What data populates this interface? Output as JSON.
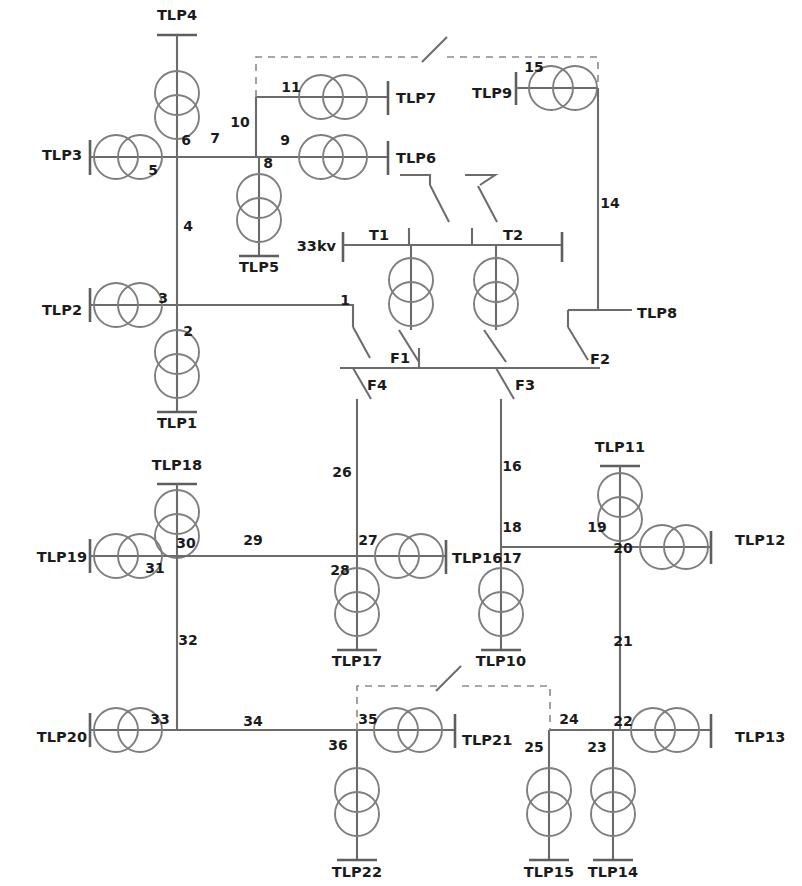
{
  "diagram": {
    "type": "single-line-diagram",
    "voltage_label": "33kv",
    "colors": {
      "wire": "#6b6b6b",
      "text": "#1b1b1b",
      "transformer": "#7e7e7e",
      "dashed_tie": "#8a8a8a",
      "background": "#ffffff"
    },
    "station_labels": [
      {
        "id": "tlp1",
        "text": "TLP1",
        "x": 177,
        "y": 428,
        "anchor": "middle"
      },
      {
        "id": "tlp2",
        "text": "TLP2",
        "x": 62,
        "y": 315,
        "anchor": "middle"
      },
      {
        "id": "tlp3",
        "text": "TLP3",
        "x": 62,
        "y": 160,
        "anchor": "middle"
      },
      {
        "id": "tlp4",
        "text": "TLP4",
        "x": 177,
        "y": 20,
        "anchor": "middle"
      },
      {
        "id": "tlp5",
        "text": "TLP5",
        "x": 259,
        "y": 272,
        "anchor": "middle"
      },
      {
        "id": "tlp6",
        "text": "TLP6",
        "x": 396,
        "y": 163,
        "anchor": "start"
      },
      {
        "id": "tlp7",
        "text": "TLP7",
        "x": 396,
        "y": 103,
        "anchor": "start"
      },
      {
        "id": "tlp8",
        "text": "TLP8",
        "x": 637,
        "y": 318,
        "anchor": "start"
      },
      {
        "id": "tlp9",
        "text": "TLP9",
        "x": 472,
        "y": 98,
        "anchor": "start"
      },
      {
        "id": "tlp10",
        "text": "TLP10",
        "x": 501,
        "y": 666,
        "anchor": "middle"
      },
      {
        "id": "tlp11",
        "text": "TLP11",
        "x": 620,
        "y": 452,
        "anchor": "middle"
      },
      {
        "id": "tlp12",
        "text": "TLP12",
        "x": 735,
        "y": 545,
        "anchor": "start"
      },
      {
        "id": "tlp13",
        "text": "TLP13",
        "x": 735,
        "y": 742,
        "anchor": "start"
      },
      {
        "id": "tlp14",
        "text": "TLP14",
        "x": 613,
        "y": 877,
        "anchor": "middle"
      },
      {
        "id": "tlp15",
        "text": "TLP15",
        "x": 549,
        "y": 877,
        "anchor": "middle"
      },
      {
        "id": "tlp16",
        "text": "TLP16",
        "x": 452,
        "y": 563,
        "anchor": "start"
      },
      {
        "id": "tlp17",
        "text": "TLP17",
        "x": 357,
        "y": 666,
        "anchor": "middle"
      },
      {
        "id": "tlp18",
        "text": "TLP18",
        "x": 177,
        "y": 470,
        "anchor": "middle"
      },
      {
        "id": "tlp19",
        "text": "TLP19",
        "x": 62,
        "y": 562,
        "anchor": "middle"
      },
      {
        "id": "tlp20",
        "text": "TLP20",
        "x": 62,
        "y": 742,
        "anchor": "middle"
      },
      {
        "id": "tlp21",
        "text": "TLP21",
        "x": 462,
        "y": 745,
        "anchor": "start"
      },
      {
        "id": "tlp22",
        "text": "TLP22",
        "x": 357,
        "y": 877,
        "anchor": "middle"
      }
    ],
    "branch_numbers": [
      {
        "id": "n1",
        "text": "1",
        "x": 345,
        "y": 305
      },
      {
        "id": "n2",
        "text": "2",
        "x": 188,
        "y": 336
      },
      {
        "id": "n3",
        "text": "3",
        "x": 163,
        "y": 303
      },
      {
        "id": "n4",
        "text": "4",
        "x": 188,
        "y": 231
      },
      {
        "id": "n5",
        "text": "5",
        "x": 153,
        "y": 175
      },
      {
        "id": "n6",
        "text": "6",
        "x": 186,
        "y": 145
      },
      {
        "id": "n7",
        "text": "7",
        "x": 215,
        "y": 143
      },
      {
        "id": "n8",
        "text": "8",
        "x": 268,
        "y": 168
      },
      {
        "id": "n9",
        "text": "9",
        "x": 285,
        "y": 145
      },
      {
        "id": "n10",
        "text": "10",
        "x": 240,
        "y": 127
      },
      {
        "id": "n11",
        "text": "11",
        "x": 291,
        "y": 92
      },
      {
        "id": "n14",
        "text": "14",
        "x": 610,
        "y": 208
      },
      {
        "id": "n15",
        "text": "15",
        "x": 534,
        "y": 72
      },
      {
        "id": "n16",
        "text": "16",
        "x": 512,
        "y": 471
      },
      {
        "id": "n17",
        "text": "17",
        "x": 512,
        "y": 563
      },
      {
        "id": "n18",
        "text": "18",
        "x": 512,
        "y": 532
      },
      {
        "id": "n19",
        "text": "19",
        "x": 597,
        "y": 532
      },
      {
        "id": "n20",
        "text": "20",
        "x": 623,
        "y": 553
      },
      {
        "id": "n21",
        "text": "21",
        "x": 623,
        "y": 646
      },
      {
        "id": "n22",
        "text": "22",
        "x": 623,
        "y": 726
      },
      {
        "id": "n23",
        "text": "23",
        "x": 597,
        "y": 752
      },
      {
        "id": "n24",
        "text": "24",
        "x": 569,
        "y": 724
      },
      {
        "id": "n25",
        "text": "25",
        "x": 534,
        "y": 752
      },
      {
        "id": "n26",
        "text": "26",
        "x": 342,
        "y": 477
      },
      {
        "id": "n27",
        "text": "27",
        "x": 368,
        "y": 545
      },
      {
        "id": "n28",
        "text": "28",
        "x": 340,
        "y": 575
      },
      {
        "id": "n29",
        "text": "29",
        "x": 253,
        "y": 545
      },
      {
        "id": "n30",
        "text": "30",
        "x": 186,
        "y": 548
      },
      {
        "id": "n31",
        "text": "31",
        "x": 155,
        "y": 573
      },
      {
        "id": "n32",
        "text": "32",
        "x": 188,
        "y": 645
      },
      {
        "id": "n33",
        "text": "33",
        "x": 160,
        "y": 724
      },
      {
        "id": "n34",
        "text": "34",
        "x": 253,
        "y": 726
      },
      {
        "id": "n35",
        "text": "35",
        "x": 368,
        "y": 724
      },
      {
        "id": "n36",
        "text": "36",
        "x": 338,
        "y": 750
      }
    ],
    "equipment_labels": [
      {
        "id": "t1",
        "text": "T1",
        "x": 389,
        "y": 240,
        "anchor": "end"
      },
      {
        "id": "t2",
        "text": "T2",
        "x": 503,
        "y": 240,
        "anchor": "start"
      },
      {
        "id": "f1",
        "text": "F1",
        "x": 390,
        "y": 363,
        "anchor": "start"
      },
      {
        "id": "f2",
        "text": "F2",
        "x": 590,
        "y": 364,
        "anchor": "start"
      },
      {
        "id": "f3",
        "text": "F3",
        "x": 515,
        "y": 390,
        "anchor": "start"
      },
      {
        "id": "f4",
        "text": "F4",
        "x": 367,
        "y": 390,
        "anchor": "start"
      },
      {
        "id": "kv33",
        "text": "33kv",
        "x": 336,
        "y": 251,
        "anchor": "end"
      }
    ],
    "legend": {
      "transformer_symbol": "two-overlapping-circles",
      "bus_symbol": "vertical-terminal-bar",
      "tie_symbol": "dashed-open-switch"
    }
  }
}
